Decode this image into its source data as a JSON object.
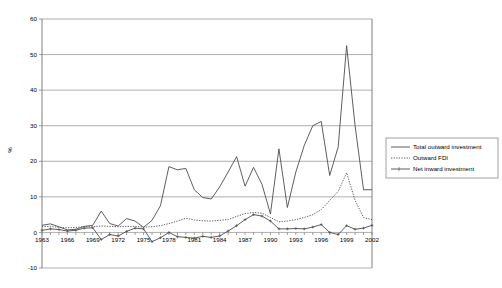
{
  "chart_data": {
    "type": "line",
    "title": "",
    "xlabel": "",
    "ylabel": "%",
    "ylim": [
      -10,
      60
    ],
    "yticks": [
      -10,
      0,
      10,
      20,
      30,
      40,
      50,
      60
    ],
    "ytick_labels": [
      "-10",
      "0",
      "10",
      "20",
      "30",
      "40",
      "50",
      "60"
    ],
    "grid": true,
    "legend_position": "right",
    "x": [
      1963,
      1964,
      1965,
      1966,
      1967,
      1968,
      1969,
      1970,
      1971,
      1972,
      1973,
      1974,
      1975,
      1976,
      1977,
      1978,
      1979,
      1980,
      1981,
      1982,
      1983,
      1984,
      1985,
      1986,
      1987,
      1988,
      1989,
      1990,
      1991,
      1992,
      1993,
      1994,
      1995,
      1996,
      1997,
      1998,
      1999,
      2000,
      2001,
      2002
    ],
    "xtick_labels": [
      "1963",
      "1966",
      "1969",
      "1972",
      "1975",
      "1978",
      "1981",
      "1984",
      "1987",
      "1990",
      "1993",
      "1996",
      "1999",
      "2002"
    ],
    "xtick_values": [
      1963,
      1966,
      1969,
      1972,
      1975,
      1978,
      1981,
      1984,
      1987,
      1990,
      1993,
      1996,
      1999,
      2002
    ],
    "series": [
      {
        "name": "Total outward investment",
        "style": "solid",
        "color": "#4d4d4d",
        "values": [
          2.0,
          2.4,
          1.6,
          0.7,
          0.9,
          1.7,
          2.0,
          6.0,
          2.5,
          1.8,
          3.9,
          3.2,
          1.4,
          3.4,
          7.5,
          18.5,
          17.6,
          18.0,
          12.0,
          9.8,
          9.4,
          12.8,
          17.0,
          21.3,
          13.0,
          18.3,
          13.5,
          5.2,
          23.5,
          7.0,
          17.0,
          24.5,
          30.0,
          31.2,
          16.0,
          24.0,
          52.5,
          30.0,
          12.0,
          12.0
        ]
      },
      {
        "name": "Outward FDI",
        "style": "dotted",
        "color": "#4d4d4d",
        "values": [
          1.6,
          1.7,
          1.4,
          1.3,
          1.4,
          1.6,
          1.6,
          1.8,
          1.7,
          1.6,
          1.7,
          1.7,
          1.5,
          1.6,
          1.9,
          2.5,
          3.2,
          4.0,
          3.5,
          3.3,
          3.2,
          3.4,
          3.6,
          4.5,
          5.3,
          5.6,
          5.4,
          4.2,
          3.0,
          3.2,
          3.6,
          4.2,
          5.0,
          6.4,
          9.0,
          11.5,
          16.8,
          9.0,
          4.2,
          3.6
        ]
      },
      {
        "name": "Net inward investment",
        "style": "solid-markers",
        "color": "#4d4d4d",
        "values": [
          0.6,
          1.0,
          0.8,
          0.4,
          0.6,
          1.2,
          1.3,
          -2.0,
          -0.6,
          -1.0,
          0.3,
          1.2,
          1.0,
          -2.6,
          -1.5,
          0.0,
          -1.2,
          -1.4,
          -1.6,
          -1.1,
          -1.4,
          -1.0,
          0.4,
          1.9,
          3.6,
          5.0,
          4.6,
          3.2,
          1.0,
          1.0,
          1.1,
          1.0,
          1.5,
          2.2,
          0.0,
          -0.6,
          1.9,
          0.9,
          1.2,
          2.0
        ]
      }
    ]
  },
  "legend": {
    "items": [
      {
        "label": "Total outward investment",
        "marker": "solid-line"
      },
      {
        "label": "Outward FDI",
        "marker": "dotted-line"
      },
      {
        "label": "Net inward investment",
        "marker": "line-with-markers"
      }
    ]
  },
  "axes": {
    "y_axis_title": "%"
  }
}
